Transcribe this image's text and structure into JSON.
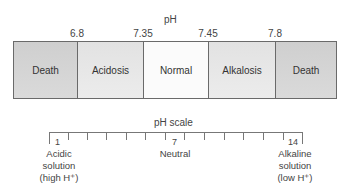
{
  "title": "pH",
  "boundaries": [
    {
      "value": "6.8",
      "x": 77
    },
    {
      "value": "7.35",
      "x": 143
    },
    {
      "value": "7.45",
      "x": 208
    },
    {
      "value": "7.8",
      "x": 275
    }
  ],
  "segments": [
    {
      "label": "Death",
      "width": 64,
      "color": "#d4d4d4"
    },
    {
      "label": "Acidosis",
      "width": 66,
      "color": "#e6e6e6"
    },
    {
      "label": "Normal",
      "width": 65,
      "color": "#fafafa"
    },
    {
      "label": "Alkalosis",
      "width": 67,
      "color": "#e6e6e6"
    },
    {
      "label": "Death",
      "width": 62,
      "color": "#d4d4d4"
    }
  ],
  "scale": {
    "title": "pH scale",
    "start_label": "1",
    "mid_label": "7",
    "end_label": "14",
    "left_caption": [
      "Acidic",
      "solution",
      "(high H⁺)"
    ],
    "mid_caption": "Neutral",
    "right_caption": [
      "Alkaline",
      "solution",
      "(low H⁺)"
    ]
  }
}
